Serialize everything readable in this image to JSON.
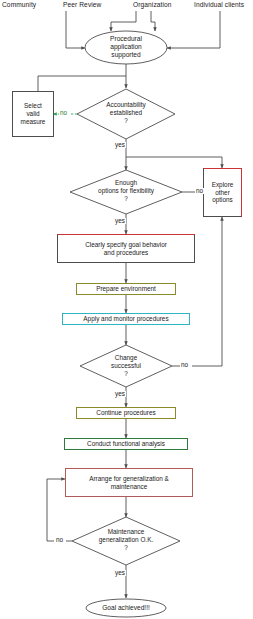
{
  "diagram": {
    "colors": {
      "line": "#4d4d4d",
      "text": "#1a1a1a",
      "green": "#2e9e4f",
      "red": "#cc3333",
      "olive": "#8a8a2a",
      "cyan": "#2fb6c4",
      "darkgreen": "#2d7a3e",
      "rose": "#b05a5a",
      "background": "#ffffff"
    },
    "sources": [
      {
        "id": "community",
        "label": "Community"
      },
      {
        "id": "peer-review",
        "label": "Peer Review"
      },
      {
        "id": "organization",
        "label": "Organization"
      },
      {
        "id": "individual-clients",
        "label": "Individual clients"
      }
    ],
    "nodes": [
      {
        "id": "procedural-application",
        "shape": "oval",
        "label": "Procedural\napplication\nsupported",
        "line1": "Procedural",
        "line2": "application",
        "line3": "supported"
      },
      {
        "id": "select-valid-measure",
        "shape": "rect",
        "label": "Select\nvalid\nmeasure",
        "line1": "Select",
        "line2": "valid",
        "line3": "measure",
        "border": "#4d4d4d"
      },
      {
        "id": "accountability-established",
        "shape": "diamond",
        "line1": "Accountability",
        "line2": "established",
        "line3": "?"
      },
      {
        "id": "enough-options",
        "shape": "diamond",
        "line1": "Enough",
        "line2": "options for flexibility",
        "line3": "?"
      },
      {
        "id": "explore-other-options",
        "shape": "rect",
        "line1": "Explore",
        "line2": "other",
        "line3": "options",
        "border": "#cc3333"
      },
      {
        "id": "clearly-specify-goal",
        "shape": "rect",
        "line1": "Clearly specify goal behavior",
        "line2": "and procedures",
        "border": "#cc3333"
      },
      {
        "id": "prepare-environment",
        "shape": "rect",
        "line1": "Prepare environment",
        "border": "#8a8a2a"
      },
      {
        "id": "apply-monitor-procedures",
        "shape": "rect",
        "line1": "Apply and monitor procedures",
        "border": "#2fb6c4"
      },
      {
        "id": "change-successful",
        "shape": "diamond",
        "line1": "Change",
        "line2": "successful",
        "line3": "?"
      },
      {
        "id": "continue-procedures",
        "shape": "rect",
        "line1": "Continue procedures",
        "border": "#8a8a2a"
      },
      {
        "id": "conduct-functional-analysis",
        "shape": "rect",
        "line1": "Conduct functional analysis",
        "border": "#2d7a3e"
      },
      {
        "id": "arrange-generalization",
        "shape": "rect",
        "line1": "Arrange for generalization &",
        "line2": "maintenance",
        "border": "#b05a5a"
      },
      {
        "id": "maintenance-generalization-ok",
        "shape": "diamond",
        "line1": "Maintenance",
        "line2": "generalization O.K.",
        "line3": "?"
      },
      {
        "id": "goal-achieved",
        "shape": "oval",
        "line1": "Goal achieved!!!"
      }
    ],
    "edge_labels": {
      "accountability_no": "no",
      "accountability_yes": "yes",
      "enough_options_no": "no",
      "enough_options_yes": "yes",
      "change_successful_no": "no",
      "change_successful_yes": "yes",
      "maintenance_no": "no",
      "maintenance_yes": "yes"
    }
  }
}
